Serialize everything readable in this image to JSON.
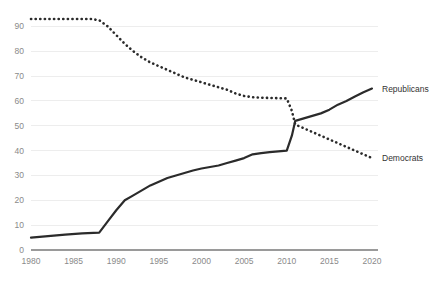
{
  "chart_data": {
    "type": "line",
    "title": "",
    "subtitle": "",
    "xlabel": "",
    "ylabel": "",
    "xlim": [
      1980,
      2020
    ],
    "ylim": [
      0,
      95
    ],
    "grid": true,
    "legend_position": "right-inline-labels",
    "x_ticks": [
      "1980",
      "1985",
      "1990",
      "1995",
      "2000",
      "2005",
      "2010",
      "2015",
      "2020"
    ],
    "x_tick_values": [
      1980,
      1985,
      1990,
      1995,
      2000,
      2005,
      2010,
      2015,
      2020
    ],
    "y_ticks": [
      "0",
      "10",
      "20",
      "30",
      "40",
      "50",
      "60",
      "70",
      "80",
      "90"
    ],
    "y_tick_values": [
      0,
      10,
      20,
      30,
      40,
      50,
      60,
      70,
      80,
      90
    ],
    "series": [
      {
        "name": "Democrats",
        "style": "dotted",
        "color": "#2b2b2b",
        "label": "Democrats",
        "x": [
          1980,
          1982,
          1984,
          1986,
          1987,
          1988,
          1989,
          1990,
          1991,
          1992,
          1993,
          1994,
          1995,
          1996,
          1997,
          1998,
          1999,
          2000,
          2001,
          2002,
          2003,
          2004,
          2005,
          2006,
          2007,
          2008,
          2009,
          2010,
          2010.6,
          2011,
          2012,
          2013,
          2014,
          2015,
          2016,
          2017,
          2018,
          2019,
          2020
        ],
        "values": [
          93,
          93,
          93,
          93,
          93,
          92.5,
          90,
          86.5,
          83,
          80,
          77.5,
          75.5,
          74,
          72.5,
          71,
          69.5,
          68.5,
          67.5,
          66.5,
          65.5,
          64.5,
          63,
          62,
          61.5,
          61.3,
          61.2,
          61.1,
          61,
          56,
          50.5,
          49,
          47.5,
          46,
          44.5,
          43,
          41.5,
          40,
          38.5,
          37
        ]
      },
      {
        "name": "Republicans",
        "style": "solid",
        "color": "#2b2b2b",
        "label": "Republicans",
        "x": [
          1980,
          1982,
          1984,
          1986,
          1988,
          1989,
          1990,
          1991,
          1992,
          1993,
          1994,
          1995,
          1996,
          1997,
          1998,
          1999,
          2000,
          2001,
          2002,
          2003,
          2004,
          2005,
          2006,
          2007,
          2008,
          2009,
          2010,
          2010.6,
          2011,
          2012,
          2013,
          2014,
          2015,
          2016,
          2017,
          2018,
          2019,
          2020
        ],
        "values": [
          5,
          5.6,
          6.2,
          6.7,
          7,
          11.5,
          16,
          20,
          22,
          24,
          26,
          27.5,
          29,
          30,
          31,
          32,
          32.8,
          33.4,
          34,
          35,
          36,
          37,
          38.5,
          39,
          39.4,
          39.7,
          40,
          46,
          52,
          53,
          54,
          55,
          56.5,
          58.5,
          60,
          61.8,
          63.5,
          65
        ]
      }
    ]
  },
  "labels": {
    "republicans": "Republicans",
    "democrats": "Democrats"
  },
  "colors": {
    "line": "#2b2b2b",
    "gridline": "#ededed",
    "axis": "#9a9a9a",
    "tick_text": "#8a8a8a",
    "label_text": "#333333",
    "background": "#ffffff"
  }
}
